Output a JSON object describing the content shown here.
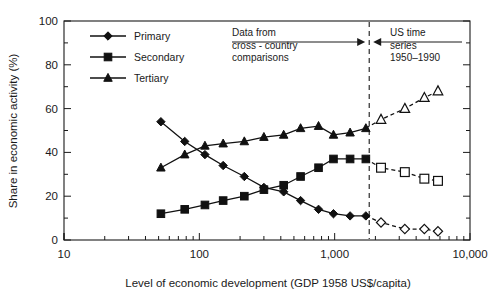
{
  "chart_data": {
    "type": "line",
    "title": "",
    "xlabel": "Level of economic development (GDP 1958 US$/capita)",
    "ylabel": "Share in economic activity (%)",
    "xscale": "log",
    "xlim": [
      10,
      10000
    ],
    "ylim": [
      0,
      100
    ],
    "grid": false,
    "legend_position": "top-left",
    "x_tick_labels": [
      "10",
      "100",
      "1,000",
      "10,000"
    ],
    "x_tick_values": [
      10,
      100,
      1000,
      10000
    ],
    "y_tick_labels": [
      "0",
      "20",
      "40",
      "60",
      "80",
      "100"
    ],
    "y_tick_values": [
      0,
      20,
      40,
      60,
      80,
      100
    ],
    "y_minor_tick_values": [
      10,
      30,
      50,
      70,
      90
    ],
    "series": [
      {
        "name": "Primary",
        "marker": "diamond",
        "x": [
          52,
          78,
          110,
          150,
          215,
          300,
          420,
          560,
          760,
          980,
          1300,
          1700
        ],
        "values": [
          54,
          45,
          39,
          34,
          29,
          24,
          22,
          18,
          14,
          12,
          11,
          11
        ],
        "segment": "cross-country",
        "fill": "filled"
      },
      {
        "name": "Primary",
        "marker": "diamond",
        "x": [
          1700,
          2200,
          3300,
          4600,
          5800
        ],
        "values": [
          11,
          8,
          5,
          5,
          4
        ],
        "segment": "us-time-series",
        "fill": "open"
      },
      {
        "name": "Secondary",
        "marker": "square",
        "x": [
          52,
          78,
          110,
          150,
          215,
          300,
          420,
          560,
          760,
          980,
          1300,
          1700
        ],
        "values": [
          12,
          14,
          16,
          18,
          20,
          23,
          25,
          29,
          33,
          37,
          37,
          37
        ],
        "segment": "cross-country",
        "fill": "filled"
      },
      {
        "name": "Secondary",
        "marker": "square",
        "x": [
          1700,
          2200,
          3300,
          4600,
          5800
        ],
        "values": [
          37,
          33,
          31,
          28,
          27
        ],
        "segment": "us-time-series",
        "fill": "open"
      },
      {
        "name": "Tertiary",
        "marker": "triangle",
        "x": [
          52,
          78,
          110,
          150,
          215,
          300,
          420,
          560,
          760,
          980,
          1300,
          1700
        ],
        "values": [
          33,
          39,
          43,
          44,
          45,
          47,
          48,
          51,
          52,
          48,
          49,
          51
        ],
        "segment": "cross-country",
        "fill": "filled"
      },
      {
        "name": "Tertiary",
        "marker": "triangle",
        "x": [
          1700,
          2200,
          3300,
          4600,
          5800
        ],
        "values": [
          51,
          55,
          60,
          65,
          68
        ],
        "segment": "us-time-series",
        "fill": "open"
      }
    ],
    "annotations": [
      {
        "id": "left-annotation",
        "lines": [
          "Data from",
          "cross - country",
          "comparisons"
        ],
        "arrow": "right"
      },
      {
        "id": "right-annotation",
        "lines": [
          "US time",
          "series",
          "1950–1990"
        ],
        "arrow": "left"
      }
    ],
    "divider": {
      "x_value": 1800,
      "style": "dashed"
    }
  },
  "legend": {
    "items": [
      {
        "label": "Primary",
        "marker": "diamond"
      },
      {
        "label": "Secondary",
        "marker": "square"
      },
      {
        "label": "Tertiary",
        "marker": "triangle"
      }
    ]
  }
}
